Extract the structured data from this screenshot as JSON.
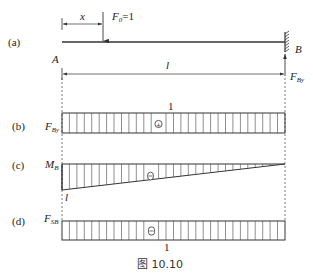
{
  "figure": {
    "caption": "图 10.10",
    "colors": {
      "line": "#333333",
      "hatch": "#555555",
      "background": "#ffffff"
    }
  },
  "panel_a": {
    "tag": "(a)",
    "left_support": "A",
    "right_support": "B",
    "load_label": "F",
    "load_sub": "0",
    "load_value": "=1",
    "position_label": "x",
    "span_label": "l",
    "reaction_label": "F",
    "reaction_sub": "By"
  },
  "panel_b": {
    "tag": "(b)",
    "quantity": "F",
    "quantity_sub": "By",
    "value_label": "1",
    "sign": "+"
  },
  "panel_c": {
    "tag": "(c)",
    "quantity": "M",
    "quantity_sub": "B",
    "value_label": "l",
    "sign": "−"
  },
  "panel_d": {
    "tag": "(d)",
    "quantity": "F",
    "quantity_sub": "SB",
    "value_label": "1",
    "sign": "−"
  }
}
